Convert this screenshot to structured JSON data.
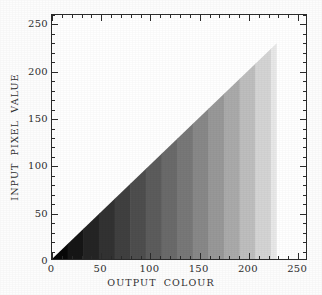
{
  "chart_data": {
    "type": "area",
    "title": "",
    "subtitle": "",
    "xlabel": "OUTPUT COLOUR",
    "ylabel": "INPUT PIXEL VALUE",
    "xlim": [
      0,
      260
    ],
    "ylim": [
      0,
      260
    ],
    "xticks": [
      0,
      50,
      100,
      150,
      200,
      250
    ],
    "yticks": [
      0,
      50,
      100,
      150,
      200,
      250
    ],
    "xticklabels": [
      "0",
      "50",
      "100",
      "150",
      "200",
      "250"
    ],
    "yticklabels": [
      "0",
      "50",
      "100",
      "150",
      "200",
      "250"
    ],
    "minor_tick_interval": 10,
    "grid": false,
    "legend": null,
    "legend_position": "none",
    "series": [
      {
        "name": "identity mapping boundary",
        "x": [
          0,
          230
        ],
        "values": [
          0,
          230
        ]
      }
    ],
    "fill": {
      "type": "horizontal-greyscale-ramp",
      "direction": "left-to-right",
      "band_count": 16,
      "band_width_units": 16,
      "bands": [
        {
          "index": 0,
          "x_start": 0,
          "x_end": 16,
          "grey": 8,
          "hex": "#080808"
        },
        {
          "index": 1,
          "x_start": 16,
          "x_end": 32,
          "grey": 22,
          "hex": "#161616"
        },
        {
          "index": 2,
          "x_start": 32,
          "x_end": 48,
          "grey": 36,
          "hex": "#242424"
        },
        {
          "index": 3,
          "x_start": 48,
          "x_end": 64,
          "grey": 50,
          "hex": "#323232"
        },
        {
          "index": 4,
          "x_start": 64,
          "x_end": 80,
          "grey": 64,
          "hex": "#404040"
        },
        {
          "index": 5,
          "x_start": 80,
          "x_end": 96,
          "grey": 78,
          "hex": "#4e4e4e"
        },
        {
          "index": 6,
          "x_start": 96,
          "x_end": 112,
          "grey": 92,
          "hex": "#5c5c5c"
        },
        {
          "index": 7,
          "x_start": 112,
          "x_end": 128,
          "grey": 106,
          "hex": "#6a6a6a"
        },
        {
          "index": 8,
          "x_start": 128,
          "x_end": 144,
          "grey": 120,
          "hex": "#787878"
        },
        {
          "index": 9,
          "x_start": 144,
          "x_end": 160,
          "grey": 136,
          "hex": "#888888"
        },
        {
          "index": 10,
          "x_start": 160,
          "x_end": 176,
          "grey": 152,
          "hex": "#989898"
        },
        {
          "index": 11,
          "x_start": 176,
          "x_end": 192,
          "grey": 170,
          "hex": "#aaaaaa"
        },
        {
          "index": 12,
          "x_start": 192,
          "x_end": 208,
          "grey": 190,
          "hex": "#bebebe"
        },
        {
          "index": 13,
          "x_start": 208,
          "x_end": 224,
          "grey": 212,
          "hex": "#d4d4d4"
        },
        {
          "index": 14,
          "x_start": 224,
          "x_end": 240,
          "grey": 232,
          "hex": "#e8e8e8"
        },
        {
          "index": 15,
          "x_start": 240,
          "x_end": 256,
          "grey": 246,
          "hex": "#f6f6f6"
        }
      ]
    },
    "colors": {
      "axis": "#2b2b2b",
      "text": "#2f2f2f",
      "background": "#ffffff",
      "ramp_start": "#000000",
      "ramp_end": "#ffffff"
    }
  }
}
